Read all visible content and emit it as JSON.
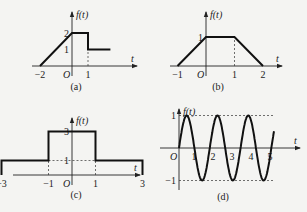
{
  "chart_data": [
    {
      "id": "a",
      "type": "line",
      "caption": "(a)",
      "ylabel": "f(t)",
      "xlabel": "t",
      "origin_label": "O",
      "points": [
        [
          -2,
          0
        ],
        [
          0,
          2
        ],
        [
          1,
          2
        ],
        [
          1,
          1
        ],
        [
          2.4,
          1
        ]
      ],
      "xticks": [
        {
          "v": -2,
          "label": "−2"
        },
        {
          "v": 1,
          "label": "1"
        }
      ],
      "yticks": [
        {
          "v": 2,
          "label": "2"
        },
        {
          "v": 1,
          "label": "1"
        }
      ],
      "dashed": [
        [
          [
            1,
            0
          ],
          [
            1,
            1
          ]
        ]
      ],
      "xlim": [
        -2.5,
        3.5
      ],
      "ylim": [
        0,
        2.8
      ]
    },
    {
      "id": "b",
      "type": "line",
      "caption": "(b)",
      "ylabel": "f(t)",
      "xlabel": "t",
      "origin_label": "O",
      "points": [
        [
          -1,
          0
        ],
        [
          0,
          1
        ],
        [
          1,
          1
        ],
        [
          2,
          0
        ]
      ],
      "xticks": [
        {
          "v": -1,
          "label": "−1"
        },
        {
          "v": 1,
          "label": "1"
        },
        {
          "v": 2,
          "label": "2"
        }
      ],
      "yticks": [
        {
          "v": 1,
          "label": "1"
        }
      ],
      "dashed": [
        [
          [
            1,
            0
          ],
          [
            1,
            1
          ]
        ]
      ],
      "xlim": [
        -1.3,
        2.5
      ],
      "ylim": [
        0,
        1.5
      ]
    },
    {
      "id": "c",
      "type": "line",
      "caption": "(c)",
      "ylabel": "f(t)",
      "xlabel": "t",
      "origin_label": "O",
      "points": [
        [
          -3,
          0
        ],
        [
          -3,
          1
        ],
        [
          -1,
          1
        ],
        [
          -1,
          3
        ],
        [
          1,
          3
        ],
        [
          1,
          1
        ],
        [
          3,
          1
        ],
        [
          3,
          0
        ]
      ],
      "xticks": [
        {
          "v": -3,
          "label": "−3"
        },
        {
          "v": -1,
          "label": "−1"
        },
        {
          "v": 1,
          "label": "1"
        },
        {
          "v": 3,
          "label": "3"
        }
      ],
      "yticks": [
        {
          "v": 3,
          "label": "3"
        },
        {
          "v": 1,
          "label": "1"
        }
      ],
      "dashed": [
        [
          [
            -1,
            0
          ],
          [
            -1,
            1
          ]
        ],
        [
          [
            1,
            0
          ],
          [
            1,
            1
          ]
        ],
        [
          [
            -1,
            1
          ],
          [
            1,
            1
          ]
        ]
      ],
      "xlim": [
        -3.5,
        4.2
      ],
      "ylim": [
        0,
        3.8
      ]
    },
    {
      "id": "d",
      "type": "line",
      "caption": "(d)",
      "ylabel": "f(t)",
      "xlabel": "t",
      "origin_label": "O",
      "function": "sin",
      "amplitude": 1,
      "period": 1.62,
      "domain": [
        0,
        5
      ],
      "xticks": [
        {
          "v": 1,
          "label": "1"
        },
        {
          "v": 2,
          "label": "2"
        },
        {
          "v": 3,
          "label": "3"
        },
        {
          "v": 4,
          "label": "4"
        },
        {
          "v": 5,
          "label": "5"
        }
      ],
      "yticks": [
        {
          "v": 1,
          "label": "1"
        },
        {
          "v": -1,
          "label": "−1"
        }
      ],
      "dashed_levels": [
        1,
        -1
      ],
      "xlim": [
        0,
        5.6
      ],
      "ylim": [
        -1.2,
        1.45
      ]
    }
  ]
}
